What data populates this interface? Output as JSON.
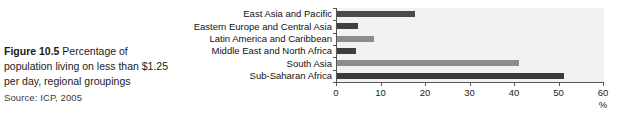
{
  "caption": {
    "line1_strong": "Figure 10.5",
    "line1_rest": " Percentage of",
    "line2": "population living on less than $1.25",
    "line3": "per day, regional groupings",
    "source": "Source: ICP, 2005"
  },
  "colors": {
    "bar_dark": "#4a4a4a",
    "bar_light": "#8c8c8c",
    "plot_background": "#f2f2f2",
    "axis": "#555555",
    "text": "#111111"
  },
  "chart_data": {
    "type": "bar",
    "orientation": "horizontal",
    "title": "",
    "subtitle": "",
    "xlabel": "%",
    "ylabel": "",
    "xlim": [
      0,
      60
    ],
    "xticks": [
      0,
      10,
      20,
      30,
      40,
      50,
      60
    ],
    "xticklabels": [
      "0",
      "10",
      "20",
      "30",
      "40",
      "50",
      "60"
    ],
    "grid": false,
    "legend": "none",
    "categories": [
      "East Asia and Pacific",
      "Eastern Europe and Central Asia",
      "Latin America and Caribbean",
      "Middle East and North Africa",
      "South Asia",
      "Sub-Saharan Africa"
    ],
    "values": [
      17.5,
      4.7,
      8.3,
      4.3,
      40.9,
      51.0
    ],
    "bar_colors": [
      "#4a4a4a",
      "#3f3f3f",
      "#8c8c8c",
      "#3f3f3f",
      "#8c8c8c",
      "#3a3a3a"
    ],
    "annotations": []
  }
}
